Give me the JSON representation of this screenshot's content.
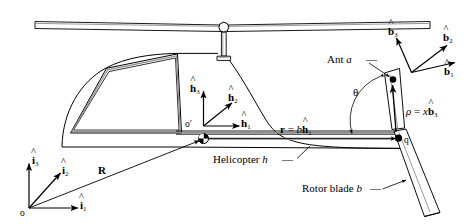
{
  "figure": {
    "background_color": "#ffffff",
    "line_color": "#000000",
    "shade_color": "#9a9a9a",
    "width": 467,
    "height": 224
  },
  "inertial_frame": {
    "origin_label": "o",
    "axes": [
      {
        "name": "i3",
        "base": "i",
        "sub": "3",
        "label": "î₃"
      },
      {
        "name": "i2",
        "base": "i",
        "sub": "2",
        "label": "î₂"
      },
      {
        "name": "i1",
        "base": "i",
        "sub": "1",
        "label": "î₁"
      }
    ]
  },
  "body_frame": {
    "origin_label": "o′",
    "axes": [
      {
        "name": "h3",
        "base": "h",
        "sub": "3",
        "label": "ĥ₃"
      },
      {
        "name": "h2",
        "base": "h",
        "sub": "2",
        "label": "ĥ₂"
      },
      {
        "name": "h1",
        "base": "h",
        "sub": "1",
        "label": "ĥ₁"
      }
    ]
  },
  "blade_frame": {
    "axes": [
      {
        "name": "b3",
        "base": "b",
        "sub": "3",
        "label": "b̂₃"
      },
      {
        "name": "b2",
        "base": "b",
        "sub": "2",
        "label": "b̂₂"
      },
      {
        "name": "b1",
        "base": "b",
        "sub": "1",
        "label": "b̂₁"
      }
    ]
  },
  "vectors": {
    "R": {
      "symbol": "R",
      "description": "position vector from o to o′"
    },
    "r": {
      "lhs": "r",
      "eq": "=",
      "coefficient": "b",
      "unit_base": "h",
      "unit_sub": "1",
      "full": "r = b ĥ₁"
    },
    "rho": {
      "lhs": "ρ",
      "eq": "=",
      "coefficient": "x",
      "unit_base": "b",
      "unit_sub": "3",
      "full": "ρ = x b̂₃"
    }
  },
  "angles": {
    "theta": {
      "symbol": "θ",
      "description": "blade pitch / rotation angle from r to blade"
    }
  },
  "points": [
    {
      "name": "o",
      "label": "o",
      "description": "inertial origin"
    },
    {
      "name": "op",
      "label": "o′",
      "description": "helicopter body origin"
    },
    {
      "name": "q",
      "label": "q",
      "description": "rotor blade root point"
    },
    {
      "name": "a",
      "label": "a",
      "description": "ant position on blade"
    }
  ],
  "annotations": [
    {
      "name": "ant",
      "text": "Ant",
      "italic_suffix": "a",
      "full": "Ant a"
    },
    {
      "name": "helicopter",
      "text": "Helicopter",
      "italic_suffix": "h",
      "full": "Helicopter h"
    },
    {
      "name": "rotor_blade",
      "text": "Rotor blade",
      "italic_suffix": "b",
      "full": "Rotor blade b"
    }
  ]
}
